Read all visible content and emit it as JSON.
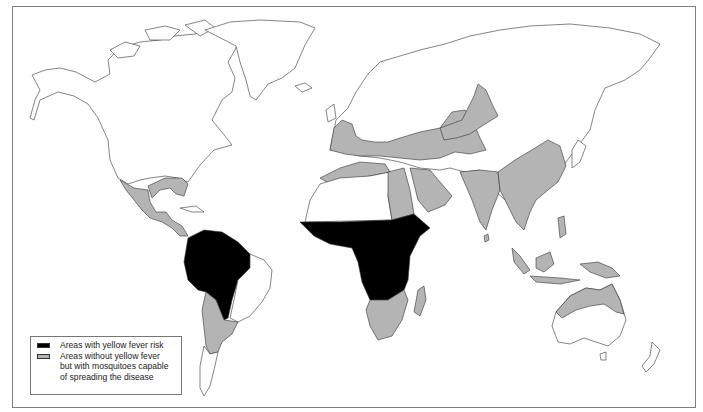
{
  "map": {
    "title": "",
    "projection": "world",
    "colors": {
      "risk": "#000000",
      "mosquito": "#b4b4b4",
      "land": "#ffffff",
      "outline": "#333333",
      "frame": "#808080"
    },
    "regions_with_risk": [
      "Northern South America",
      "Sub-Saharan Africa (central belt)"
    ],
    "regions_with_mosquitoes": [
      "Southern United States / Gulf coast",
      "Mexico and Central America",
      "Southern South America (Paraguay, Argentina, Chile)",
      "Southern Europe and Mediterranean",
      "North Africa coast",
      "Middle East",
      "Central Asia",
      "India",
      "Southeast Asia",
      "Eastern China",
      "Indonesia and Philippines",
      "New Guinea",
      "Northern Australia",
      "Southern Africa",
      "Madagascar"
    ]
  },
  "legend": {
    "items": [
      {
        "label": "Areas with yellow fever risk",
        "color": "#000000"
      },
      {
        "label": "Areas without yellow fever\nbut with mosquitoes capable\nof spreading the disease",
        "color": "#b4b4b4"
      }
    ]
  }
}
